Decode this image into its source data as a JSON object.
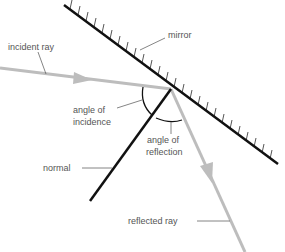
{
  "diagram": {
    "type": "ray-reflection",
    "labels": {
      "mirror": "mirror",
      "incident_ray": "incident ray",
      "angle_incidence_1": "angle of",
      "angle_incidence_2": "incidence",
      "angle_reflection_1": "angle of",
      "angle_reflection_2": "reflection",
      "normal": "normal",
      "reflected_ray": "reflected ray"
    },
    "colors": {
      "mirror": "#111111",
      "ray": "#bdbdbd",
      "normal": "#111111",
      "label": "#555555"
    }
  }
}
